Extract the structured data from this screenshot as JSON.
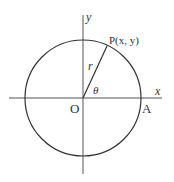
{
  "diagram": {
    "type": "unit-circle-polar-coordinates",
    "colors": {
      "stroke": "#333333",
      "axis": "#555555",
      "background": "#ffffff"
    },
    "labels": {
      "y_axis": "y",
      "x_axis": "x",
      "point": "P(x, y)",
      "radius": "r",
      "angle": "θ",
      "origin": "O",
      "point_a": "A"
    },
    "geometry": {
      "center": [
        83,
        98
      ],
      "radius": 58,
      "point_p": [
        107,
        46
      ],
      "point_a": [
        141,
        98
      ],
      "x_axis_range": [
        9,
        162
      ],
      "y_axis_range": [
        15,
        174
      ]
    }
  }
}
